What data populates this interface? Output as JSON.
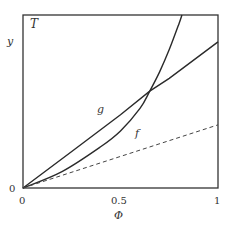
{
  "chart_data": {
    "type": "line",
    "title": "",
    "panel_label": "T",
    "xlabel": "Φ",
    "ylabel": "y",
    "xlim": [
      0,
      1
    ],
    "ylim": [
      0,
      1
    ],
    "x_ticks": [
      "0",
      "0.5",
      "1"
    ],
    "y_ticks": [
      "0"
    ],
    "grid": false,
    "legend": null,
    "series": [
      {
        "name": "g",
        "style": "solid",
        "x": [
          0,
          0.25,
          0.5,
          0.65,
          0.75,
          1.0
        ],
        "values": [
          0,
          0.211,
          0.423,
          0.56,
          0.634,
          0.845
        ]
      },
      {
        "name": "f",
        "style": "solid",
        "x": [
          0,
          0.2,
          0.4,
          0.5,
          0.6,
          0.65,
          0.7,
          0.75,
          0.8,
          0.815
        ],
        "values": [
          0,
          0.095,
          0.24,
          0.33,
          0.46,
          0.56,
          0.67,
          0.8,
          0.95,
          1.0
        ]
      },
      {
        "name": "dashed",
        "style": "dashed",
        "x": [
          0,
          1.0
        ],
        "values": [
          0,
          0.365
        ]
      }
    ],
    "annotations": [
      {
        "text": "g",
        "x": 0.4,
        "y": 0.45
      },
      {
        "text": "f",
        "x": 0.585,
        "y": 0.31
      }
    ]
  },
  "labels": {
    "panel": "T",
    "ylabel": "y",
    "xlabel": "Φ",
    "x_tick_0": "0",
    "x_tick_05": "0.5",
    "x_tick_1": "1",
    "y_tick_0": "0",
    "curve_g": "g",
    "curve_f": "f"
  }
}
